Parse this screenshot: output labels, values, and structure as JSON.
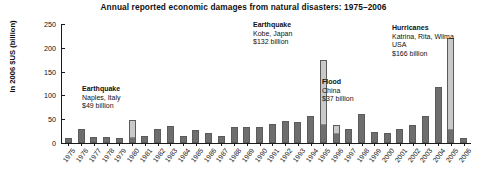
{
  "chart_data": {
    "type": "bar",
    "title": "Annual reported economic damages from natural disasters: 1975–2006",
    "xlabel": "",
    "ylabel": "In 2006 $US (billion)",
    "ylim": [
      0,
      250
    ],
    "yticks": [
      0,
      50,
      100,
      150,
      200,
      250
    ],
    "ytick_labels": [
      "0",
      "50",
      "100",
      "150",
      "200",
      "250"
    ],
    "grid": false,
    "legend": "none",
    "categories": [
      "1975",
      "1976",
      "1977",
      "1978",
      "1979",
      "1980",
      "1981",
      "1982",
      "1983",
      "1984",
      "1985",
      "1986",
      "1987",
      "1988",
      "1989",
      "1990",
      "1991",
      "1992",
      "1993",
      "1994",
      "1995",
      "1996",
      "1997",
      "1998",
      "1999",
      "2000",
      "2001",
      "2002",
      "2003",
      "2004",
      "2005",
      "2006"
    ],
    "values": [
      10,
      30,
      13,
      12,
      10,
      49,
      15,
      30,
      36,
      14,
      28,
      22,
      15,
      33,
      34,
      33,
      40,
      47,
      45,
      56,
      175,
      37,
      30,
      62,
      24,
      22,
      29,
      38,
      56,
      118,
      220,
      11
    ],
    "base_values": [
      10,
      30,
      13,
      12,
      10,
      12,
      15,
      30,
      36,
      14,
      28,
      22,
      15,
      33,
      34,
      33,
      40,
      47,
      45,
      56,
      40,
      20,
      30,
      62,
      24,
      22,
      29,
      38,
      56,
      118,
      30,
      11
    ],
    "highlighted": [
      {
        "year": "1980",
        "from": 12,
        "to": 49
      },
      {
        "year": "1995",
        "from": 40,
        "to": 175
      },
      {
        "year": "1996",
        "from": 20,
        "to": 37
      },
      {
        "year": "2005",
        "from": 30,
        "to": 220
      }
    ],
    "annotations": [
      {
        "id": "naples",
        "event": "Earthquake",
        "location": "Naples, Italy",
        "amount": "$49 billion",
        "year": "1980"
      },
      {
        "id": "kobe",
        "event": "Earthquake",
        "location": "Kobe, Japan",
        "amount": "$132 billion",
        "year": "1995"
      },
      {
        "id": "china-flood",
        "event": "Flood",
        "location": "China",
        "amount": "$37 billion",
        "year": "1996"
      },
      {
        "id": "hurricanes",
        "event": "Hurricanes",
        "location": "Katrina, Rita, Wilma",
        "location2": "USA",
        "amount": "$166 billion",
        "year": "2005"
      }
    ],
    "colors": {
      "bar": "#6e6e6e",
      "highlight": "#c9c9c9",
      "axis": "#1a1a1a",
      "text": "#111111",
      "background": "#ffffff"
    }
  }
}
